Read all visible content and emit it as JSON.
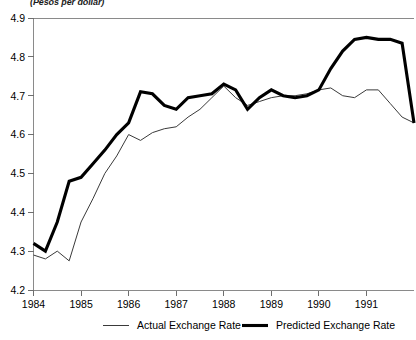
{
  "units_label": "(Pesos per dollar)",
  "chart_data": {
    "type": "line",
    "title": "",
    "subtitle": "",
    "xlabel": "",
    "ylabel": "(Pesos per dollar)",
    "ylim": [
      4.2,
      4.9
    ],
    "yticks": [
      4.2,
      4.3,
      4.4,
      4.5,
      4.6,
      4.7,
      4.8,
      4.9
    ],
    "ytick_labels": [
      "4.2",
      "4.3",
      "4.4",
      "4.5",
      "4.6",
      "4.7",
      "4.8",
      "4.9"
    ],
    "xlim": [
      1984.0,
      1992.0
    ],
    "xticks": [
      1984,
      1985,
      1986,
      1987,
      1988,
      1989,
      1990,
      1991
    ],
    "xtick_labels": [
      "1984",
      "1985",
      "1986",
      "1987",
      "1988",
      "1989",
      "1990",
      "1991"
    ],
    "grid": false,
    "legend_position": "bottom",
    "x": [
      1984.0,
      1984.25,
      1984.5,
      1984.75,
      1985.0,
      1985.25,
      1985.5,
      1985.75,
      1986.0,
      1986.25,
      1986.5,
      1986.75,
      1987.0,
      1987.25,
      1987.5,
      1987.75,
      1988.0,
      1988.25,
      1988.5,
      1988.75,
      1989.0,
      1989.25,
      1989.5,
      1989.75,
      1990.0,
      1990.25,
      1990.5,
      1990.75,
      1991.0,
      1991.25,
      1991.5,
      1991.75,
      1992.0
    ],
    "series": [
      {
        "name": "Actual Exchange Rate",
        "style": "thin",
        "color": "#3a3a3a",
        "values": [
          4.29,
          4.28,
          4.3,
          4.275,
          4.375,
          4.435,
          4.5,
          4.545,
          4.6,
          4.585,
          4.605,
          4.615,
          4.62,
          4.645,
          4.665,
          4.695,
          4.725,
          4.695,
          4.675,
          4.685,
          4.695,
          4.7,
          4.7,
          4.705,
          4.715,
          4.72,
          4.7,
          4.695,
          4.715,
          4.715,
          4.68,
          4.645,
          4.63
        ]
      },
      {
        "name": "Predicted Exchange Rate",
        "style": "thick",
        "color": "#000000",
        "values": [
          4.32,
          4.3,
          4.375,
          4.48,
          4.49,
          4.525,
          4.56,
          4.6,
          4.63,
          4.71,
          4.705,
          4.675,
          4.665,
          4.695,
          4.7,
          4.705,
          4.73,
          4.715,
          4.665,
          4.695,
          4.715,
          4.7,
          4.695,
          4.7,
          4.715,
          4.77,
          4.815,
          4.845,
          4.85,
          4.845,
          4.845,
          4.835,
          4.63
        ]
      }
    ]
  },
  "legend": {
    "items": [
      {
        "label": "Actual Exchange Rate",
        "style": "thin"
      },
      {
        "label": "Predicted Exchange Rate",
        "style": "thick"
      }
    ]
  }
}
